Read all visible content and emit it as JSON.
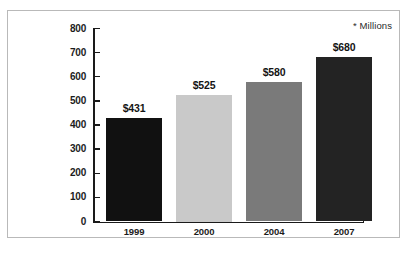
{
  "chart_data": {
    "type": "bar",
    "title": "",
    "subtitle": "",
    "xlabel": "",
    "ylabel": "",
    "categories": [
      "1999",
      "2000",
      "2004",
      "2007"
    ],
    "values": [
      431,
      525,
      580,
      680
    ],
    "data_labels": [
      "$431",
      "$525",
      "$580",
      "$680"
    ],
    "bar_colors": [
      "#111111",
      "#c9c9c9",
      "#7a7a7a",
      "#232323"
    ],
    "ylim": [
      0,
      800
    ],
    "ytick_values": [
      0,
      100,
      200,
      300,
      400,
      500,
      600,
      700,
      800
    ],
    "ytick_labels": [
      "0",
      "100",
      "200",
      "300",
      "400",
      "500",
      "600",
      "700",
      "800"
    ],
    "grid": false,
    "legend": null,
    "annotations": [
      {
        "name": "units-note",
        "text": "* Millions",
        "position": "top-right"
      }
    ]
  },
  "frame": {
    "border_color": "#b9b9b9",
    "background": "#ffffff"
  },
  "axis": {
    "line_color": "#1a1a1a"
  }
}
